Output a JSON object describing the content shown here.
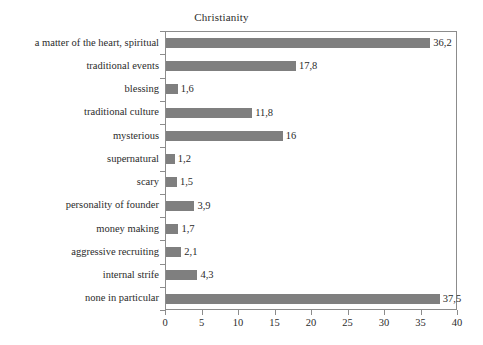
{
  "chart_data": {
    "type": "bar",
    "orientation": "horizontal",
    "title": "Christianity",
    "xlabel": "",
    "ylabel": "",
    "xlim": [
      0,
      40
    ],
    "xticks": [
      0,
      5,
      10,
      15,
      20,
      25,
      30,
      35,
      40
    ],
    "xtick_labels": [
      "0",
      "5",
      "10",
      "15",
      "20",
      "25",
      "30",
      "35",
      "40"
    ],
    "grid": false,
    "legend": null,
    "bar_color": "#7f7f7f",
    "frame_color": "#8c8c8c",
    "decimal_separator": ",",
    "categories": [
      "a matter of the heart, spiritual",
      "traditional events",
      "blessing",
      "traditional culture",
      "mysterious",
      "supernatural",
      "scary",
      "personality of founder",
      "money making",
      "aggressive recruiting",
      "internal strife",
      "none in particular"
    ],
    "values": [
      36.2,
      17.8,
      1.6,
      11.8,
      16,
      1.2,
      1.5,
      3.9,
      1.7,
      2.1,
      4.3,
      37.5
    ],
    "value_labels": [
      "36,2",
      "17,8",
      "1,6",
      "11,8",
      "16",
      "1,2",
      "1,5",
      "3,9",
      "1,7",
      "2,1",
      "4,3",
      "37,5"
    ]
  }
}
